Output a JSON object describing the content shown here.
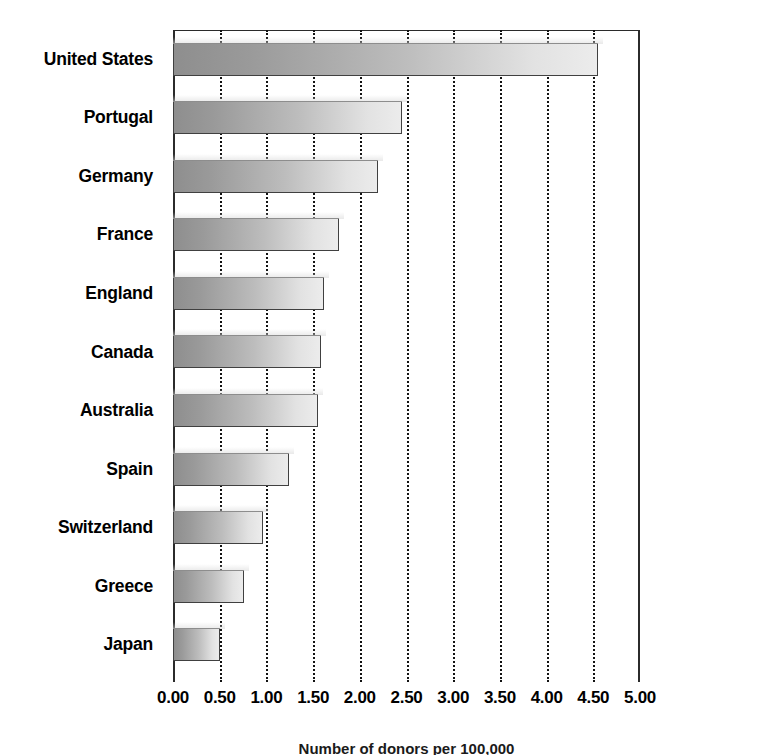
{
  "chart_data": {
    "type": "bar",
    "orientation": "horizontal",
    "title": "",
    "subtitle": "",
    "xlabel": "Number of donors per 100,000",
    "ylabel": "",
    "categories": [
      "United States",
      "Portugal",
      "Germany",
      "France",
      "England",
      "Canada",
      "Australia",
      "Spain",
      "Switzerland",
      "Greece",
      "Japan"
    ],
    "values": [
      4.55,
      2.45,
      2.2,
      1.78,
      1.62,
      1.58,
      1.55,
      1.24,
      0.96,
      0.76,
      0.5
    ],
    "series": [
      {
        "name": "Rate",
        "values": [
          4.55,
          2.45,
          2.2,
          1.78,
          1.62,
          1.58,
          1.55,
          1.24,
          0.96,
          0.76,
          0.5
        ]
      }
    ],
    "xlim": [
      0.0,
      5.0
    ],
    "xticks": [
      0.0,
      0.5,
      1.0,
      1.5,
      2.0,
      2.5,
      3.0,
      3.5,
      4.0,
      4.5,
      5.0
    ],
    "xtick_labels": [
      "0.00",
      "0.50",
      "1.00",
      "1.50",
      "2.00",
      "2.50",
      "3.00",
      "3.50",
      "4.00",
      "4.50",
      "5.00"
    ],
    "grid": true,
    "grid_style": "dotted-vertical",
    "legend": false,
    "legend_position": "none",
    "bar_fill": "gray-gradient-left-dark-to-right-light",
    "bar_border_color": "#404040",
    "background_color": "#ffffff"
  },
  "axis": {
    "caption": "Number of donors per 100,000"
  }
}
